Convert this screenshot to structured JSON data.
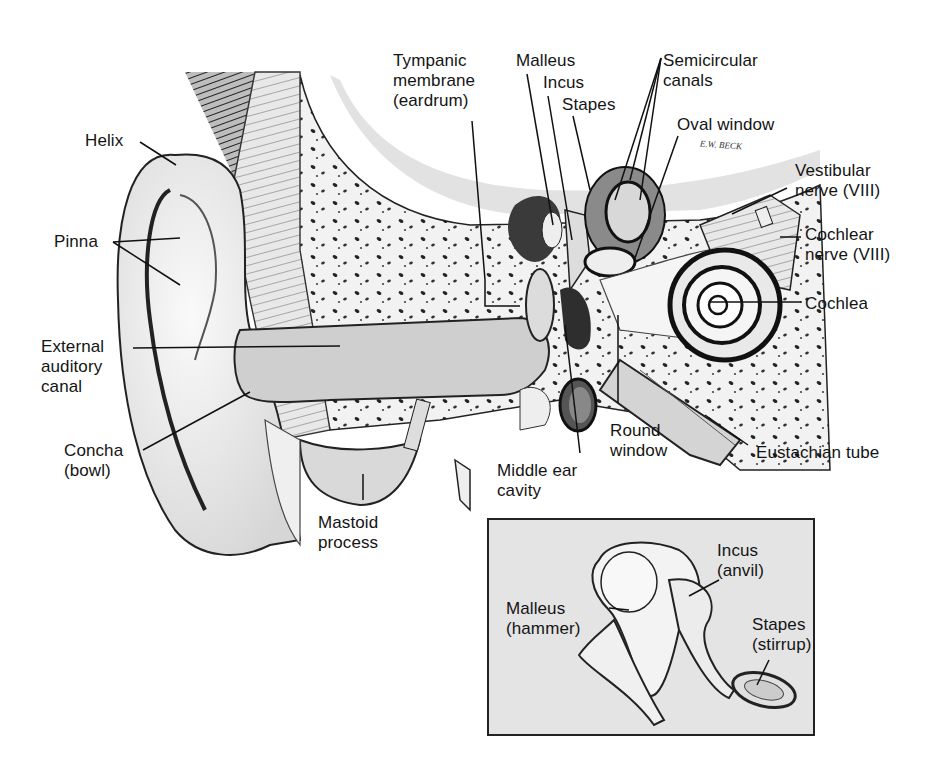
{
  "diagram": {
    "signature": "E.W. BECK",
    "main_labels": [
      {
        "id": "helix",
        "text": "Helix"
      },
      {
        "id": "pinna",
        "text": "Pinna"
      },
      {
        "id": "external-auditory-canal",
        "text": "External\nauditory\ncanal"
      },
      {
        "id": "concha",
        "text": "Concha\n(bowl)"
      },
      {
        "id": "mastoid-process",
        "text": "Mastoid\nprocess"
      },
      {
        "id": "tympanic-membrane",
        "text": "Tympanic\nmembrane\n(eardrum)"
      },
      {
        "id": "malleus",
        "text": "Malleus"
      },
      {
        "id": "incus",
        "text": "Incus"
      },
      {
        "id": "stapes",
        "text": "Stapes"
      },
      {
        "id": "semicircular-canals",
        "text": "Semicircular\ncanals"
      },
      {
        "id": "oval-window",
        "text": "Oval window"
      },
      {
        "id": "vestibular-nerve",
        "text": "Vestibular\nnerve (VIII)"
      },
      {
        "id": "cochlear-nerve",
        "text": "Cochlear\nnerve (VIII)"
      },
      {
        "id": "cochlea",
        "text": "Cochlea"
      },
      {
        "id": "eustachian-tube",
        "text": "Eustachian tube"
      },
      {
        "id": "round-window",
        "text": "Round\nwindow"
      },
      {
        "id": "middle-ear-cavity",
        "text": "Middle ear\ncavity"
      }
    ],
    "inset": {
      "title": "Ossicles detail",
      "labels": [
        {
          "id": "inset-malleus",
          "text": "Malleus\n(hammer)"
        },
        {
          "id": "inset-incus",
          "text": "Incus\n(anvil)"
        },
        {
          "id": "inset-stapes",
          "text": "Stapes\n(stirrup)"
        }
      ]
    }
  }
}
